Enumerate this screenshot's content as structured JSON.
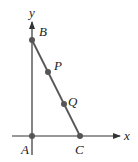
{
  "diagram": {
    "axes": {
      "x_label": "x",
      "y_label": "y"
    },
    "points": {
      "A": {
        "label": "A",
        "x": 32,
        "y": 136
      },
      "B": {
        "label": "B",
        "x": 32,
        "y": 40
      },
      "C": {
        "label": "C",
        "x": 80,
        "y": 136
      },
      "P": {
        "label": "P",
        "x": 48,
        "y": 72
      },
      "Q": {
        "label": "Q",
        "x": 64,
        "y": 104
      }
    },
    "colors": {
      "axis": "#333333",
      "segment": "#555555",
      "point": "#555555"
    }
  }
}
